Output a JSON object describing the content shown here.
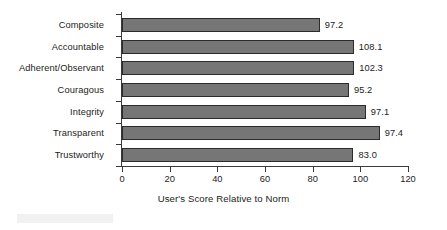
{
  "chart_data": {
    "type": "bar",
    "orientation": "horizontal",
    "title": "",
    "xlabel": "User's Score Relative to Norm",
    "ylabel": "",
    "xlim": [
      0,
      120
    ],
    "xticks": [
      "0",
      "20",
      "40",
      "60",
      "80",
      "100",
      "120"
    ],
    "grid": false,
    "legend": null,
    "bar_color": "#767676",
    "bar_edge_color": "#2b2b2b",
    "categories": [
      "Composite",
      "Accountable",
      "Adherent/Observant",
      "Couragous",
      "Integrity",
      "Transparent",
      "Trustworthy"
    ],
    "values": [
      97.2,
      108.1,
      102.3,
      95.2,
      97.1,
      97.4,
      83.0
    ],
    "value_labels": [
      "97.2",
      "108.1",
      "102.3",
      "95.2",
      "97.1",
      "97.4",
      "83.0"
    ],
    "drawn_bar_lengths": [
      83.0,
      97.2,
      97.4,
      95.2,
      102.3,
      108.1,
      97.1
    ]
  }
}
